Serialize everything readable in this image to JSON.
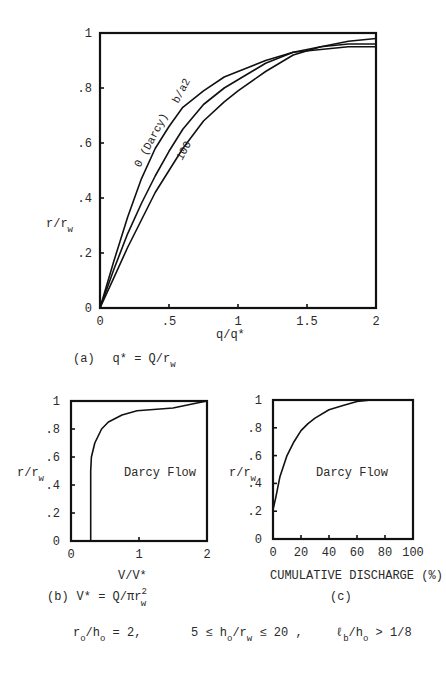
{
  "chart_data": [
    {
      "id": "a",
      "type": "line",
      "title": "",
      "caption": "(a)  q* = Q/r_w",
      "xlabel": "q/q*",
      "ylabel": "r/r_w",
      "xlim": [
        0,
        2
      ],
      "ylim": [
        0,
        1
      ],
      "xticks": [
        0,
        0.5,
        1,
        1.5,
        2
      ],
      "xtick_labels": [
        "0",
        ".5",
        "1",
        "1.5",
        "2"
      ],
      "yticks": [
        0,
        0.2,
        0.4,
        0.6,
        0.8,
        1
      ],
      "ytick_labels": [
        "0",
        ".2",
        ".4",
        ".6",
        ".8",
        "1"
      ],
      "grid": false,
      "legend": "inline curve labels",
      "series": [
        {
          "name": "0 (Darcy)",
          "x": [
            0,
            0.1,
            0.2,
            0.3,
            0.4,
            0.5,
            0.6,
            0.75,
            0.9,
            1.0,
            1.2,
            1.4,
            1.6,
            1.8,
            2.0
          ],
          "y": [
            0,
            0.17,
            0.33,
            0.47,
            0.58,
            0.66,
            0.73,
            0.79,
            0.84,
            0.86,
            0.9,
            0.93,
            0.94,
            0.95,
            0.95
          ]
        },
        {
          "name": "b/a2",
          "x": [
            0,
            0.1,
            0.2,
            0.3,
            0.4,
            0.5,
            0.6,
            0.75,
            0.9,
            1.0,
            1.2,
            1.4,
            1.6,
            1.8,
            2.0
          ],
          "y": [
            0,
            0.14,
            0.27,
            0.38,
            0.48,
            0.57,
            0.65,
            0.74,
            0.8,
            0.83,
            0.89,
            0.93,
            0.95,
            0.96,
            0.96
          ]
        },
        {
          "name": "100",
          "x": [
            0,
            0.1,
            0.2,
            0.3,
            0.4,
            0.5,
            0.6,
            0.75,
            0.9,
            1.0,
            1.2,
            1.4,
            1.6,
            1.8,
            2.0
          ],
          "y": [
            0,
            0.11,
            0.22,
            0.32,
            0.42,
            0.5,
            0.58,
            0.68,
            0.75,
            0.79,
            0.86,
            0.92,
            0.95,
            0.97,
            0.98
          ]
        }
      ]
    },
    {
      "id": "b",
      "type": "line",
      "caption": "(b)  V* = Q/πr_w^2",
      "xlabel": "V/V*",
      "ylabel": "r/r_w",
      "xlim": [
        0,
        2
      ],
      "ylim": [
        0,
        1
      ],
      "xticks": [
        0,
        1,
        2
      ],
      "xtick_labels": [
        "0",
        "1",
        "2"
      ],
      "yticks": [
        0,
        0.2,
        0.4,
        0.6,
        0.8,
        1
      ],
      "ytick_labels": [
        "0",
        ".2",
        ".4",
        ".6",
        ".8",
        "1"
      ],
      "grid": false,
      "annotation": "Darcy Flow",
      "series": [
        {
          "name": "Darcy Flow",
          "x": [
            0.29,
            0.29,
            0.3,
            0.35,
            0.45,
            0.55,
            0.75,
            0.97,
            1.5,
            1.8,
            2.0
          ],
          "y": [
            0,
            0.5,
            0.6,
            0.7,
            0.8,
            0.85,
            0.9,
            0.93,
            0.95,
            0.98,
            1.0
          ]
        }
      ]
    },
    {
      "id": "c",
      "type": "line",
      "caption": "(c)",
      "xlabel": "CUMULATIVE DISCHARGE (%)",
      "ylabel": "r/r_w",
      "xlim": [
        0,
        100
      ],
      "ylim": [
        0,
        1
      ],
      "xticks": [
        0,
        20,
        40,
        60,
        80,
        100
      ],
      "xtick_labels": [
        "0",
        "20",
        "40",
        "60",
        "80",
        "100"
      ],
      "yticks": [
        0,
        0.2,
        0.4,
        0.6,
        0.8,
        1
      ],
      "ytick_labels": [
        "0",
        ".2",
        ".4",
        ".6",
        ".8",
        "1"
      ],
      "grid": false,
      "annotation": "Darcy Flow",
      "series": [
        {
          "name": "Darcy Flow",
          "x": [
            0,
            2,
            5,
            10,
            15,
            20,
            25,
            30,
            40,
            50,
            60,
            70,
            100
          ],
          "y": [
            0.21,
            0.3,
            0.45,
            0.6,
            0.7,
            0.78,
            0.83,
            0.87,
            0.93,
            0.96,
            0.99,
            1.0,
            1.0
          ]
        }
      ]
    }
  ],
  "figure": {
    "a": {
      "xlabel": "q/q*",
      "ylabel_main": "r/r",
      "ylabel_sub": "w",
      "caption_prefix": "(a)",
      "caption_main": "q* = Q/r",
      "caption_sub": "w",
      "curve_labels": [
        "0 (Darcy)",
        "b/a2",
        "100"
      ]
    },
    "b": {
      "xlabel": "V/V*",
      "ylabel_main": "r/r",
      "ylabel_sub": "w",
      "annotation": "Darcy Flow",
      "caption_prefix": "(b)",
      "caption_main": "V* = Q/πr",
      "caption_sup": "2",
      "caption_sub": "w"
    },
    "c": {
      "xlabel": "CUMULATIVE DISCHARGE (%)",
      "ylabel_main": "r/r",
      "ylabel_sub": "w",
      "annotation": "Darcy Flow",
      "caption": "(c)"
    },
    "conditions": {
      "c1_main": "r",
      "c1_sub1": "o",
      "c1_mid": "/h",
      "c1_sub2": "o",
      "c1_end": " = 2,",
      "c2_start": "5 ≤ h",
      "c2_sub1": "o",
      "c2_mid": "/r",
      "c2_sub2": "w",
      "c2_end": " ≤ 20 ,",
      "c3_start": "ℓ",
      "c3_sub1": "b",
      "c3_mid": "/h",
      "c3_sub2": "o",
      "c3_end": " > 1/8"
    }
  }
}
